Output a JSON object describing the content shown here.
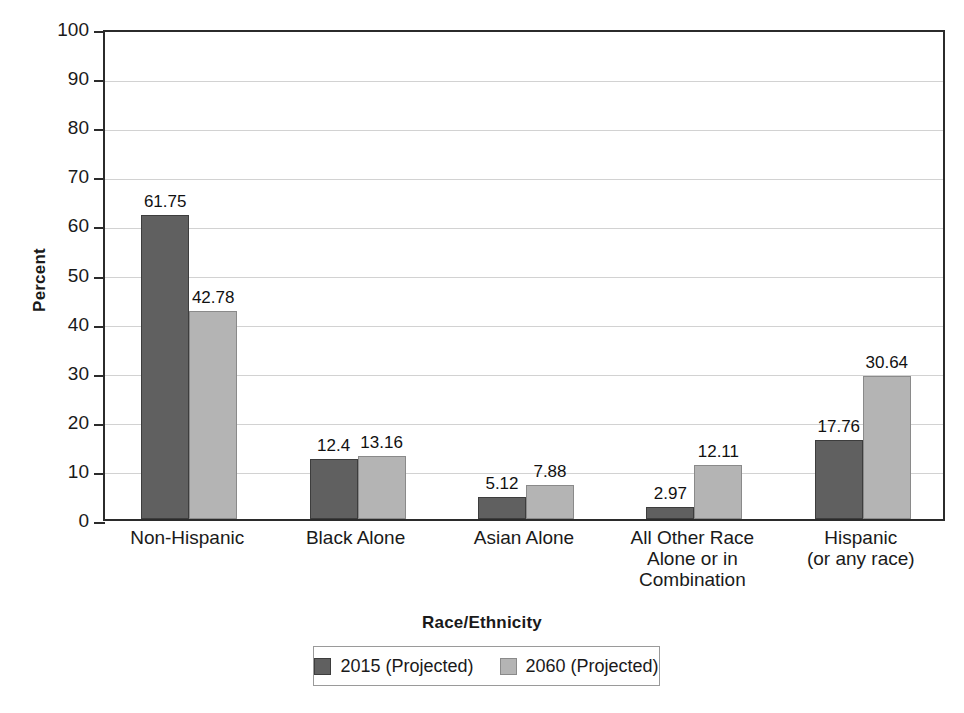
{
  "chart_data": {
    "type": "bar",
    "title": "",
    "xlabel": "Race/Ethnicity",
    "ylabel": "Percent",
    "ylim": [
      0,
      100
    ],
    "ytick_step": 10,
    "yticks": [
      "100",
      "90",
      "80",
      "70",
      "60",
      "50",
      "40",
      "30",
      "20",
      "10",
      "0"
    ],
    "grid": "horizontal",
    "legend_position": "bottom",
    "categories": [
      "Non-Hispanic",
      "Black Alone",
      "Asian Alone",
      "All Other Race Alone or in Combination",
      "Hispanic (or any race)"
    ],
    "category_lines": [
      [
        "Non-Hispanic"
      ],
      [
        "Black Alone"
      ],
      [
        "Asian Alone"
      ],
      [
        "All Other Race",
        "Alone or in",
        "Combination"
      ],
      [
        "Hispanic",
        "(or any race)"
      ]
    ],
    "series": [
      {
        "name": "2015 (Projected)",
        "color": "#606060",
        "values": [
          61.75,
          12.4,
          5.12,
          2.97,
          17.76
        ],
        "labels": [
          "61.75",
          "12.4",
          "5.12",
          "2.97",
          "17.76"
        ],
        "drawn_heights": [
          62.0,
          12.2,
          4.5,
          2.5,
          16.0
        ]
      },
      {
        "name": "2060 (Projected)",
        "color": "#b4b4b4",
        "values": [
          42.78,
          13.16,
          7.88,
          12.11,
          30.64
        ],
        "labels": [
          "42.78",
          "13.16",
          "7.88",
          "12.11",
          "30.64"
        ],
        "drawn_heights": [
          42.3,
          12.8,
          6.9,
          11.1,
          29.1
        ]
      }
    ]
  },
  "legend": {
    "items": [
      {
        "label": "2015 (Projected)",
        "swatch": "dark-gray"
      },
      {
        "label": "2060 (Projected)",
        "swatch": "light-gray"
      }
    ]
  }
}
